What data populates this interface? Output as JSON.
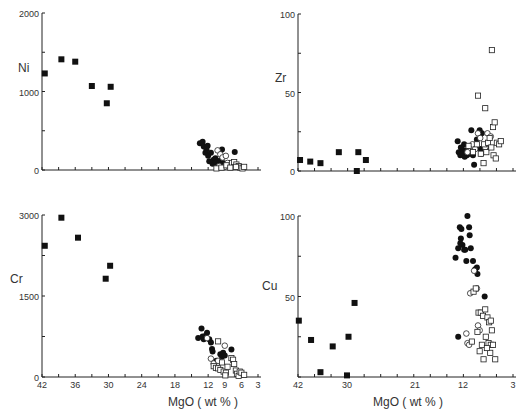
{
  "figure": {
    "xlabel": "MgO ( wt % )"
  },
  "chart_data": [
    {
      "type": "scatter",
      "panel": "top-left",
      "ylabel": "Ni",
      "xlabel": "",
      "xlim": [
        42,
        3
      ],
      "ylim": [
        0,
        2000
      ],
      "yticks": [
        0,
        1000,
        2000
      ],
      "xticks_minor": true,
      "series": [
        {
          "name": "filled-square",
          "points": [
            [
              41.5,
              1230
            ],
            [
              38.5,
              1410
            ],
            [
              36,
              1380
            ],
            [
              33,
              1070
            ],
            [
              30.3,
              850
            ],
            [
              29.6,
              1060
            ]
          ]
        },
        {
          "name": "filled-circle",
          "points": [
            [
              13.5,
              340
            ],
            [
              13,
              360
            ],
            [
              12.8,
              300
            ],
            [
              12.3,
              260
            ],
            [
              12.1,
              310
            ],
            [
              12.5,
              220
            ],
            [
              12,
              180
            ],
            [
              11.5,
              220
            ],
            [
              11,
              130
            ],
            [
              11.2,
              80
            ],
            [
              10.7,
              150
            ],
            [
              10.5,
              100
            ],
            [
              10.2,
              70
            ],
            [
              9.8,
              120
            ],
            [
              9.5,
              260
            ],
            [
              9.3,
              90
            ],
            [
              9,
              60
            ],
            [
              7.2,
              230
            ],
            [
              11.8,
              110
            ]
          ]
        },
        {
          "name": "open-circle",
          "points": [
            [
              10.3,
              250
            ],
            [
              9.8,
              200
            ],
            [
              9.4,
              160
            ],
            [
              8.8,
              180
            ],
            [
              8.5,
              90
            ],
            [
              9,
              40
            ],
            [
              10,
              50
            ]
          ]
        },
        {
          "name": "open-square",
          "points": [
            [
              10.5,
              20
            ],
            [
              9.6,
              30
            ],
            [
              8.7,
              60
            ],
            [
              7.7,
              90
            ],
            [
              7.3,
              100
            ],
            [
              6.9,
              70
            ],
            [
              6.5,
              50
            ],
            [
              6.2,
              30
            ],
            [
              5.8,
              20
            ],
            [
              5.5,
              40
            ],
            [
              7,
              40
            ],
            [
              8,
              30
            ]
          ]
        }
      ]
    },
    {
      "type": "scatter",
      "panel": "top-right",
      "ylabel": "Zr",
      "xlabel": "",
      "xlim": [
        42,
        3
      ],
      "ylim": [
        0,
        100
      ],
      "yticks": [
        0,
        50,
        100
      ],
      "series": [
        {
          "name": "filled-square",
          "points": [
            [
              41.5,
              7
            ],
            [
              39,
              6
            ],
            [
              36.5,
              5
            ],
            [
              32,
              12
            ],
            [
              28.5,
              12
            ],
            [
              27.5,
              7
            ],
            [
              28.7,
              0
            ]
          ]
        },
        {
          "name": "filled-circle",
          "points": [
            [
              13,
              19
            ],
            [
              12.8,
              12
            ],
            [
              12.5,
              10
            ],
            [
              12.2,
              14
            ],
            [
              12,
              11
            ],
            [
              11.8,
              17
            ],
            [
              11.5,
              13
            ],
            [
              11.3,
              10
            ],
            [
              11,
              12
            ],
            [
              10.8,
              11
            ],
            [
              10.5,
              26
            ],
            [
              10.2,
              10
            ],
            [
              10,
              4
            ],
            [
              9.5,
              20
            ],
            [
              9,
              26
            ],
            [
              8.6,
              24
            ],
            [
              8.8,
              14
            ],
            [
              7.5,
              15
            ],
            [
              12.4,
              15
            ],
            [
              11.7,
              9
            ]
          ]
        },
        {
          "name": "open-circle",
          "points": [
            [
              10.3,
              17
            ],
            [
              9.8,
              14
            ],
            [
              9.3,
              24
            ],
            [
              8.9,
              21
            ],
            [
              8.7,
              11
            ],
            [
              8,
              15
            ],
            [
              7.6,
              24
            ],
            [
              7,
              22
            ],
            [
              10.7,
              13
            ],
            [
              11.2,
              12
            ]
          ]
        },
        {
          "name": "open-square",
          "points": [
            [
              9.3,
              48
            ],
            [
              8,
              40
            ],
            [
              6.8,
              77
            ],
            [
              6.6,
              28
            ],
            [
              6.3,
              31
            ],
            [
              9.5,
              17
            ],
            [
              8.8,
              11
            ],
            [
              8.2,
              17
            ],
            [
              7.8,
              12
            ],
            [
              7.5,
              18
            ],
            [
              7.2,
              21
            ],
            [
              6.9,
              15
            ],
            [
              6.5,
              10
            ],
            [
              6.1,
              8
            ],
            [
              5.9,
              18
            ],
            [
              5.5,
              17
            ],
            [
              5.2,
              19
            ],
            [
              8.3,
              5
            ],
            [
              10.2,
              12
            ],
            [
              11,
              16
            ]
          ]
        }
      ]
    },
    {
      "type": "scatter",
      "panel": "bottom-left",
      "ylabel": "Cr",
      "xlabel": "MgO ( wt % )",
      "xlim": [
        42,
        3
      ],
      "ylim": [
        0,
        3000
      ],
      "xticks": [
        42,
        36,
        30,
        24,
        18,
        12,
        9,
        6,
        3
      ],
      "yticks": [
        0,
        1500,
        3000
      ],
      "series": [
        {
          "name": "filled-square",
          "points": [
            [
              41.5,
              2430
            ],
            [
              38.5,
              2950
            ],
            [
              35.5,
              2580
            ],
            [
              30.5,
              1820
            ],
            [
              29.7,
              2060
            ]
          ]
        },
        {
          "name": "filled-circle",
          "points": [
            [
              13.8,
              720
            ],
            [
              13.2,
              900
            ],
            [
              13,
              750
            ],
            [
              12.8,
              700
            ],
            [
              12.5,
              760
            ],
            [
              12.2,
              820
            ],
            [
              11.8,
              700
            ],
            [
              11.5,
              640
            ],
            [
              11.3,
              520
            ],
            [
              11.2,
              470
            ],
            [
              10.5,
              300
            ],
            [
              9.8,
              420
            ],
            [
              9.5,
              380
            ],
            [
              9.3,
              450
            ],
            [
              9,
              400
            ],
            [
              7.8,
              510
            ]
          ]
        },
        {
          "name": "open-circle",
          "points": [
            [
              11.5,
              340
            ],
            [
              11,
              250
            ],
            [
              9,
              580
            ],
            [
              12.2,
              720
            ],
            [
              10.2,
              300
            ]
          ]
        },
        {
          "name": "open-square",
          "points": [
            [
              10.2,
              660
            ],
            [
              11,
              200
            ],
            [
              10.6,
              170
            ],
            [
              10.2,
              160
            ],
            [
              9.8,
              130
            ],
            [
              9.5,
              270
            ],
            [
              9.2,
              100
            ],
            [
              8.8,
              80
            ],
            [
              8.5,
              190
            ],
            [
              7.8,
              350
            ],
            [
              7.5,
              320
            ],
            [
              7.3,
              240
            ],
            [
              7,
              120
            ],
            [
              6.8,
              60
            ],
            [
              6.5,
              20
            ],
            [
              6.3,
              100
            ],
            [
              6,
              80
            ],
            [
              5.5,
              40
            ],
            [
              8.9,
              30
            ]
          ]
        }
      ]
    },
    {
      "type": "scatter",
      "panel": "bottom-right",
      "ylabel": "Cu",
      "xlabel": "MgO ( wt % )",
      "xlim": [
        42,
        3
      ],
      "ylim": [
        0,
        100
      ],
      "xticks": [
        42,
        30,
        21,
        12,
        3
      ],
      "yticks": [
        50,
        100
      ],
      "series": [
        {
          "name": "filled-square",
          "points": [
            [
              41.8,
              35
            ],
            [
              38.8,
              23
            ],
            [
              36.5,
              3
            ],
            [
              33.5,
              19
            ],
            [
              29.8,
              25
            ],
            [
              29,
              46
            ],
            [
              30,
              1
            ]
          ]
        },
        {
          "name": "filled-circle",
          "points": [
            [
              13.4,
              74
            ],
            [
              12.9,
              80
            ],
            [
              12.6,
              93
            ],
            [
              12.4,
              86
            ],
            [
              12.3,
              92
            ],
            [
              12.1,
              82
            ],
            [
              11.8,
              79
            ],
            [
              11.4,
              72
            ],
            [
              11.2,
              100
            ],
            [
              10.9,
              93
            ],
            [
              10.8,
              88
            ],
            [
              10.6,
              80
            ],
            [
              10.2,
              72
            ],
            [
              9.8,
              67
            ],
            [
              9.5,
              68
            ],
            [
              9.4,
              64
            ],
            [
              8.1,
              50
            ],
            [
              12.9,
              25
            ],
            [
              11.6,
              79
            ],
            [
              12.5,
              83
            ]
          ]
        },
        {
          "name": "open-circle",
          "points": [
            [
              10,
              66
            ],
            [
              9.5,
              55
            ],
            [
              9.3,
              32
            ],
            [
              9,
              29
            ],
            [
              11.4,
              27
            ],
            [
              11.2,
              21
            ],
            [
              10.9,
              20
            ],
            [
              10.7,
              52
            ]
          ]
        },
        {
          "name": "open-square",
          "points": [
            [
              10.1,
              53
            ],
            [
              9.7,
              55
            ],
            [
              9.2,
              40
            ],
            [
              8.8,
              40
            ],
            [
              8.4,
              38
            ],
            [
              8,
              42
            ],
            [
              7.6,
              37
            ],
            [
              7.3,
              34
            ],
            [
              7,
              35
            ],
            [
              6.8,
              29
            ],
            [
              7.9,
              25
            ],
            [
              7.4,
              21
            ],
            [
              7,
              20
            ],
            [
              6.6,
              20
            ],
            [
              8.6,
              20
            ],
            [
              9,
              16
            ],
            [
              9.4,
              28
            ],
            [
              8.3,
              11
            ],
            [
              7.1,
              15
            ],
            [
              6.2,
              11
            ],
            [
              10.4,
              22
            ],
            [
              7.7,
              18
            ]
          ]
        }
      ]
    }
  ],
  "panels_layout": {
    "top-left": {
      "x0": 42,
      "y0": 170,
      "yTop": 13,
      "ymax": 2000,
      "ylabelX": 18,
      "ylabelY": 72,
      "ticks": [
        [
          0,
          "0"
        ],
        [
          1000,
          "1000"
        ],
        [
          2000,
          "2000"
        ]
      ]
    },
    "top-right": {
      "x0": 298,
      "y0": 171,
      "yTop": 14,
      "ymax": 100,
      "ylabelX": 275,
      "ylabelY": 82,
      "ticks": [
        [
          0,
          "0"
        ],
        [
          50,
          "50"
        ],
        [
          100,
          "100"
        ]
      ]
    },
    "bottom-left": {
      "x0": 42,
      "y0": 377,
      "yTop": 215,
      "ymax": 3000,
      "ylabelX": 10,
      "ylabelY": 283,
      "ticks": [
        [
          0,
          "0"
        ],
        [
          1500,
          "1500"
        ],
        [
          3000,
          "3000"
        ]
      ]
    },
    "bottom-right": {
      "x0": 298,
      "y0": 377,
      "yTop": 216,
      "ymax": 100,
      "ylabelX": 262,
      "ylabelY": 290,
      "ticks": [
        [
          50,
          "50"
        ],
        [
          100,
          "100"
        ]
      ]
    }
  }
}
